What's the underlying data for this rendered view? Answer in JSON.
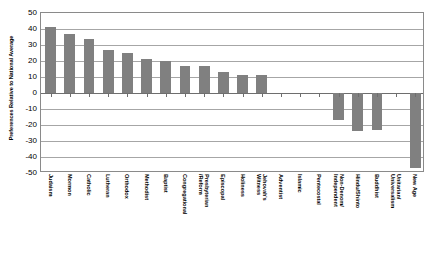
{
  "chart_data": {
    "type": "bar",
    "title": "",
    "xlabel": "",
    "ylabel": "Preferences Relative to National Average",
    "ylim": [
      -50,
      50
    ],
    "ytick_step": 10,
    "yticks": [
      50,
      40,
      30,
      20,
      10,
      0,
      -10,
      -20,
      -30,
      -40,
      -50
    ],
    "ytick_labels": [
      "50",
      "40",
      "30",
      "20",
      "10",
      "0",
      "-10",
      "-20",
      "-30",
      "-40",
      "-50"
    ],
    "grid": "horizontal",
    "legend": "none",
    "bar_color": "#808080",
    "categories": [
      "Judaism",
      "Mormon",
      "Catholic",
      "Lutheran",
      "Orthodox",
      "Methodist",
      "Baptist",
      "Congregational",
      "Presbyterian/Reform",
      "Episcopal",
      "Holiness",
      "Jehovah's Witness",
      "Adventist",
      "Islamic",
      "Pentecostal",
      "Non-Denom/Independent",
      "Hindu/Shinto",
      "Buddhist",
      "Unitarian/Universalism",
      "New Age"
    ],
    "category_label_lines": [
      [
        "Judaism"
      ],
      [
        "Mormon"
      ],
      [
        "Catholic"
      ],
      [
        "Lutheran"
      ],
      [
        "Orthodox"
      ],
      [
        "Methodist"
      ],
      [
        "Baptist"
      ],
      [
        "Congregational"
      ],
      [
        "Presbyterian",
        "/Reform"
      ],
      [
        "Episcopal"
      ],
      [
        "Holiness"
      ],
      [
        "Jehovah's",
        "Witness"
      ],
      [
        "Adventist"
      ],
      [
        "Islamic"
      ],
      [
        "Pentecostal"
      ],
      [
        "Non-Denom/",
        "Independent"
      ],
      [
        "Hindu/Shinto"
      ],
      [
        "Buddhist"
      ],
      [
        "Unitarian/",
        "Universalism"
      ],
      [
        "New Age"
      ]
    ],
    "values": [
      41,
      37,
      34,
      27,
      25,
      21,
      20,
      17,
      17,
      13,
      11,
      11,
      0,
      0,
      0,
      -17,
      -24,
      -23,
      0,
      -47
    ]
  }
}
